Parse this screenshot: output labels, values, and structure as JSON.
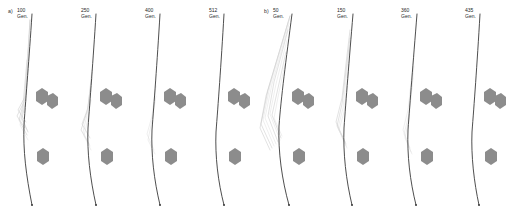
{
  "figure": {
    "title_visible": false,
    "background_color": "#ffffff",
    "trunk_color": "#3a3a3a",
    "branch_color": "#c9c9c9",
    "blob_color": "#8c8c8c",
    "unit_label": "Gen."
  },
  "groups": [
    {
      "id": "a",
      "label": "a)",
      "label_x": 8,
      "label_y": 10,
      "x": 0,
      "width": 256,
      "panels": [
        {
          "id": "a1",
          "generation": "100",
          "unit": "Gen.",
          "x": 0,
          "fan": "medium",
          "blobs": 3
        },
        {
          "id": "a2",
          "generation": "250",
          "unit": "Gen.",
          "x": 64,
          "fan": "medium",
          "blobs": 3
        },
        {
          "id": "a3",
          "generation": "400",
          "unit": "Gen.",
          "x": 128,
          "fan": "light",
          "blobs": 3
        },
        {
          "id": "a4",
          "generation": "512",
          "unit": "Gen.",
          "x": 192,
          "fan": "none",
          "blobs": 3
        }
      ]
    },
    {
      "id": "b",
      "label": "b)",
      "label_x": 264,
      "label_y": 10,
      "x": 256,
      "width": 256,
      "panels": [
        {
          "id": "b1",
          "generation": "50",
          "unit": "Gen.",
          "x": 256,
          "fan": "wide",
          "blobs": 3
        },
        {
          "id": "b2",
          "generation": "150",
          "unit": "Gen.",
          "x": 320,
          "fan": "medium",
          "blobs": 3
        },
        {
          "id": "b3",
          "generation": "360",
          "unit": "Gen.",
          "x": 384,
          "fan": "light",
          "blobs": 3
        },
        {
          "id": "b4",
          "generation": "435",
          "unit": "Gen.",
          "x": 448,
          "fan": "none",
          "blobs": 3
        }
      ]
    }
  ]
}
